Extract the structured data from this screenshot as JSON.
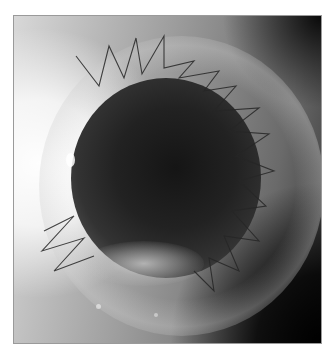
{
  "figure": {
    "color_mode": "grayscale",
    "colors": {
      "background": "#ffffff",
      "frame": "#9a9a9a",
      "pupil": "#1a1a1a",
      "suture": "#2a2a2a"
    },
    "regions": [
      {
        "name": "bright-reflection-left",
        "description": "overexposed white area on left edge"
      },
      {
        "name": "pupil",
        "description": "dark central circle"
      },
      {
        "name": "graft-ring",
        "description": "lighter circular graft margin"
      },
      {
        "name": "sutures",
        "description": "zig-zag dark suture lines around graft margin"
      },
      {
        "name": "inferior-opacity",
        "description": "whitish fibrous opacity at lower pupil margin"
      }
    ]
  }
}
